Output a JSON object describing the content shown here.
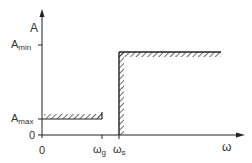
{
  "diagram": {
    "type": "lowpass-filter-tolerance-scheme",
    "y_axis": {
      "label": "A"
    },
    "x_axis": {
      "label": "ω",
      "origin": "0"
    },
    "y_ticks": [
      {
        "main": "A",
        "sub": "min"
      },
      {
        "main": "A",
        "sub": "max"
      },
      {
        "main": "0",
        "sub": ""
      }
    ],
    "x_ticks": [
      {
        "main": "ω",
        "sub": "g"
      },
      {
        "main": "ω",
        "sub": "s"
      }
    ],
    "regions": [
      {
        "name": "passband",
        "from": "0",
        "to": "ωg",
        "bound": "Amax",
        "hatch": "below"
      },
      {
        "name": "stopband",
        "from": "ωs",
        "to": "∞",
        "bound": "Amin",
        "hatch": "above/inside"
      }
    ],
    "colors": {
      "line": "#222222",
      "background": "#ffffff"
    }
  }
}
